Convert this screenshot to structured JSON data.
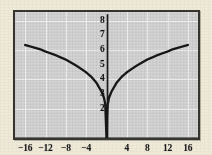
{
  "figure": {
    "background_color": "#efe9d8",
    "frame_color": "#35332e",
    "plot_background_color": "#d5d5d5",
    "grid_color": "#f2f2f2",
    "axis_color": "#1a1a1a",
    "curve_color": "#141414"
  },
  "chart_data": {
    "type": "line",
    "title": "",
    "subtitle": "",
    "xlabel": "",
    "ylabel": "",
    "xlim": [
      -18,
      18
    ],
    "ylim": [
      0,
      8.6
    ],
    "grid": true,
    "grid_x_step": 4,
    "grid_y_step": 2,
    "legend": null,
    "legend_position": "none",
    "annotations": [],
    "x_tick_labels": [
      "-16",
      "-12",
      "-8",
      "-4",
      "4",
      "8",
      "12",
      "16"
    ],
    "x_tick_values": [
      -16,
      -12,
      -8,
      -4,
      4,
      8,
      12,
      16
    ],
    "y_tick_labels": [
      "8",
      "7",
      "6",
      "5",
      "4",
      "3",
      "2"
    ],
    "y_tick_values": [
      8,
      7,
      6,
      5,
      4,
      3,
      2
    ],
    "series": [
      {
        "name": "curve",
        "x": [
          -16,
          -15,
          -14,
          -13,
          -12,
          -11,
          -10,
          -9,
          -8,
          -7,
          -6,
          -5,
          -4,
          -3,
          -2,
          -1,
          -0.5,
          -0.25,
          0,
          0.25,
          0.5,
          1,
          2,
          3,
          4,
          5,
          6,
          7,
          8,
          9,
          10,
          11,
          12,
          13,
          14,
          15,
          16
        ],
        "y": [
          6.35,
          6.25,
          6.15,
          6.05,
          5.9,
          5.78,
          5.65,
          5.5,
          5.35,
          5.15,
          4.95,
          4.72,
          4.48,
          4.18,
          3.78,
          3.18,
          2.75,
          2.31,
          0,
          2.31,
          2.75,
          3.18,
          3.78,
          4.18,
          4.48,
          4.72,
          4.95,
          5.15,
          5.35,
          5.5,
          5.65,
          5.78,
          5.9,
          6.05,
          6.15,
          6.25,
          6.35
        ]
      }
    ]
  }
}
